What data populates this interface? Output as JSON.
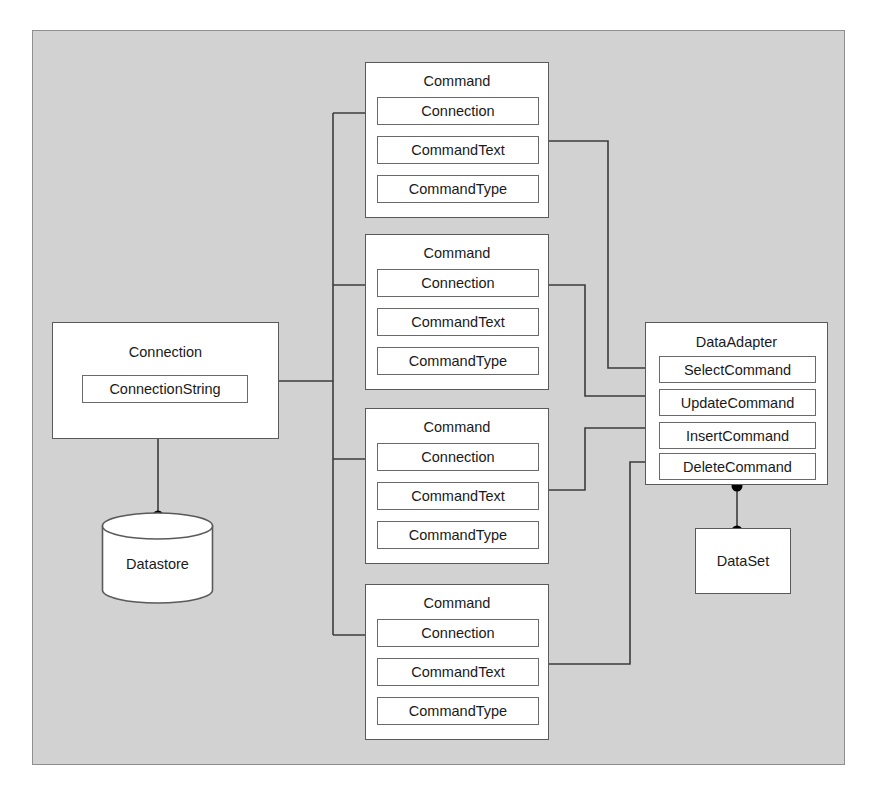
{
  "diagram": {
    "panel_color": "#d2d2d2",
    "box_fill": "#ffffff",
    "line_color": "#3c3c3c",
    "dot_color": "#000000"
  },
  "connection": {
    "title": "Connection",
    "slots": [
      {
        "label": "ConnectionString"
      }
    ]
  },
  "datastore": {
    "label": "Datastore"
  },
  "commands": [
    {
      "title": "Command",
      "slots": [
        {
          "label": "Connection"
        },
        {
          "label": "CommandText"
        },
        {
          "label": "CommandType"
        }
      ]
    },
    {
      "title": "Command",
      "slots": [
        {
          "label": "Connection"
        },
        {
          "label": "CommandText"
        },
        {
          "label": "CommandType"
        }
      ]
    },
    {
      "title": "Command",
      "slots": [
        {
          "label": "Connection"
        },
        {
          "label": "CommandText"
        },
        {
          "label": "CommandType"
        }
      ]
    },
    {
      "title": "Command",
      "slots": [
        {
          "label": "Connection"
        },
        {
          "label": "CommandText"
        },
        {
          "label": "CommandType"
        }
      ]
    }
  ],
  "dataadapter": {
    "title": "DataAdapter",
    "slots": [
      {
        "label": "SelectCommand"
      },
      {
        "label": "UpdateCommand"
      },
      {
        "label": "InsertCommand"
      },
      {
        "label": "DeleteCommand"
      }
    ]
  },
  "dataset": {
    "title": "DataSet"
  }
}
